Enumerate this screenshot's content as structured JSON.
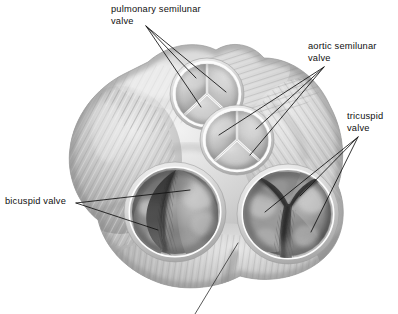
{
  "figure": {
    "background_color": "#ffffff",
    "ink_color": "#101010",
    "palette": {
      "tissue_light": "#e8e8e8",
      "tissue_mid": "#b8b8b8",
      "tissue_dark": "#8a8a8a",
      "cavity_dark": "#5a5a5a",
      "cavity_deep": "#3a3a3a",
      "rim_highlight": "#fdfdfd"
    }
  },
  "labels": [
    {
      "id": "pulmonary",
      "text": "pulmonary semilunar\nvalve",
      "line1": "pulmonary semilunar",
      "line2": "valve",
      "anchor": {
        "x": 146,
        "y": 26
      },
      "leader_count": 3,
      "targets": [
        {
          "x": 196,
          "y": 78
        },
        {
          "x": 226,
          "y": 92
        },
        {
          "x": 201,
          "y": 107
        }
      ]
    },
    {
      "id": "aortic",
      "text": "aortic semilunar\nvalve",
      "line1": "aortic semilunar",
      "line2": "valve",
      "anchor": {
        "x": 324,
        "y": 67
      },
      "leader_count": 3,
      "targets": [
        {
          "x": 219,
          "y": 135
        },
        {
          "x": 256,
          "y": 129
        },
        {
          "x": 250,
          "y": 155
        }
      ]
    },
    {
      "id": "tricuspid",
      "text": "tricuspid\nvalve",
      "line1": "tricuspid",
      "line2": "valve",
      "anchor": {
        "x": 358,
        "y": 137
      },
      "leader_count": 3,
      "targets": [
        {
          "x": 265,
          "y": 212
        },
        {
          "x": 300,
          "y": 196
        },
        {
          "x": 311,
          "y": 232
        }
      ]
    },
    {
      "id": "bicuspid",
      "text": "bicuspid valve",
      "line1": "bicuspid valve",
      "line2": "",
      "anchor": {
        "x": 76,
        "y": 203
      },
      "leader_count": 2,
      "targets": [
        {
          "x": 190,
          "y": 190
        },
        {
          "x": 158,
          "y": 230
        }
      ]
    },
    {
      "id": "unlabeled-bottom",
      "text": "",
      "line1": "",
      "line2": "",
      "anchor": {
        "x": 195,
        "y": 314
      },
      "leader_count": 1,
      "targets": [
        {
          "x": 238,
          "y": 243
        }
      ],
      "note_text_cropped": true
    }
  ],
  "structures": [
    {
      "name": "pulmonary-semilunar-valve",
      "cusps": 3,
      "center": {
        "x": 207,
        "y": 94
      },
      "rx": 33,
      "ry": 32
    },
    {
      "name": "aortic-semilunar-valve",
      "cusps": 3,
      "center": {
        "x": 237,
        "y": 140
      },
      "rx": 33,
      "ry": 30
    },
    {
      "name": "bicuspid-valve",
      "cusps": 2,
      "center": {
        "x": 175,
        "y": 212
      },
      "rx": 45,
      "ry": 44
    },
    {
      "name": "tricuspid-valve",
      "cusps": 3,
      "center": {
        "x": 288,
        "y": 214
      },
      "rx": 45,
      "ry": 44
    },
    {
      "name": "myocardium-mass",
      "center": {
        "x": 200,
        "y": 180
      }
    }
  ]
}
